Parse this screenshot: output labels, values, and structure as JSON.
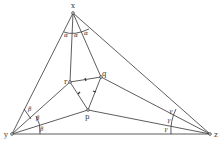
{
  "diagram": {
    "vertices": {
      "x": {
        "label": "x",
        "pos": [
          73,
          13
        ]
      },
      "y": {
        "label": "y",
        "pos": [
          12,
          134
        ]
      },
      "z": {
        "label": "z",
        "pos": [
          210,
          134
        ]
      }
    },
    "inner_points": {
      "r": {
        "label": "r",
        "pos": [
          70,
          82
        ]
      },
      "q": {
        "label": "q",
        "pos": [
          101,
          77
        ]
      },
      "p": {
        "label": "p",
        "pos": [
          88,
          110
        ]
      }
    },
    "angle_labels": {
      "alpha": "α",
      "beta": "β",
      "gamma": "γ"
    },
    "colors": {
      "line": "#333333",
      "background": "#ffffff"
    }
  }
}
